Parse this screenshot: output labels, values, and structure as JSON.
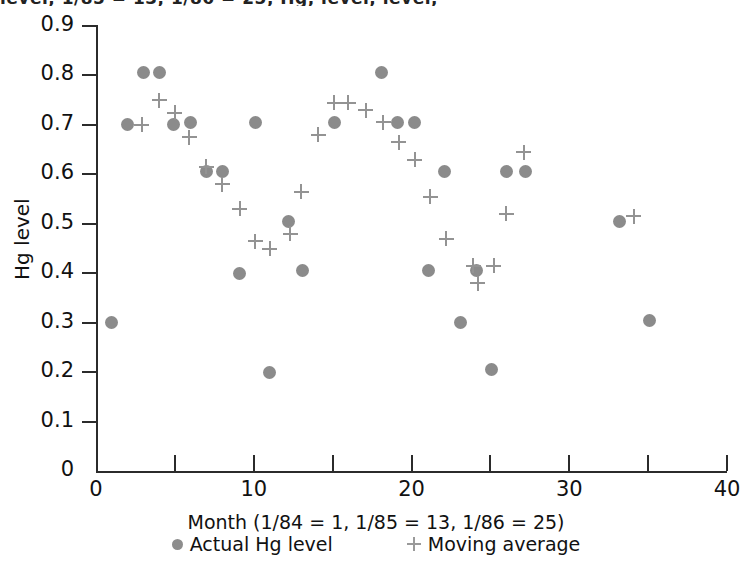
{
  "figure": {
    "cropped_header_text": "level,  1/85 = 13,  1/86 = 25,    Hg,     level,     level,"
  },
  "chart_data": {
    "type": "scatter",
    "title": "",
    "xlabel": "Month (1/84 = 1, 1/85 = 13, 1/86 = 25)",
    "ylabel": "Hg level",
    "xlim": [
      0,
      40
    ],
    "ylim": [
      0,
      0.9
    ],
    "xticks": [
      0,
      5,
      10,
      15,
      20,
      25,
      30,
      35,
      40
    ],
    "xtick_labels": [
      "0",
      "",
      "10",
      "",
      "20",
      "",
      "30",
      "",
      "40"
    ],
    "yticks": [
      0,
      0.1,
      0.2,
      0.3,
      0.4,
      0.5,
      0.6,
      0.7,
      0.8,
      0.9
    ],
    "ytick_labels": [
      "0",
      "0.1",
      "0.2",
      "0.3",
      "0.4",
      "0.5",
      "0.6",
      "0.7",
      "0.8",
      "0.9"
    ],
    "grid": false,
    "legend_position": "below-axis",
    "series": [
      {
        "name": "Actual Hg level",
        "marker": "circle",
        "color": "#8b8b8b",
        "points": [
          [
            1.0,
            0.3
          ],
          [
            2.0,
            0.7
          ],
          [
            3.0,
            0.805
          ],
          [
            4.0,
            0.805
          ],
          [
            4.9,
            0.7
          ],
          [
            6.0,
            0.705
          ],
          [
            7.0,
            0.605
          ],
          [
            8.0,
            0.605
          ],
          [
            9.1,
            0.4
          ],
          [
            10.1,
            0.705
          ],
          [
            11.0,
            0.2
          ],
          [
            12.2,
            0.505
          ],
          [
            13.1,
            0.405
          ],
          [
            15.1,
            0.705
          ],
          [
            18.1,
            0.805
          ],
          [
            19.1,
            0.705
          ],
          [
            20.2,
            0.705
          ],
          [
            21.1,
            0.405
          ],
          [
            22.1,
            0.605
          ],
          [
            23.1,
            0.3
          ],
          [
            24.1,
            0.405
          ],
          [
            25.1,
            0.205
          ],
          [
            26.0,
            0.605
          ],
          [
            27.2,
            0.605
          ],
          [
            33.2,
            0.505
          ],
          [
            35.1,
            0.305
          ]
        ]
      },
      {
        "name": "Moving average",
        "marker": "plus",
        "color": "#939393",
        "points": [
          [
            2.9,
            0.7
          ],
          [
            4.0,
            0.75
          ],
          [
            5.0,
            0.725
          ],
          [
            5.9,
            0.675
          ],
          [
            7.0,
            0.615
          ],
          [
            8.0,
            0.58
          ],
          [
            9.1,
            0.53
          ],
          [
            10.1,
            0.465
          ],
          [
            11.0,
            0.45
          ],
          [
            12.3,
            0.48
          ],
          [
            13.0,
            0.565
          ],
          [
            14.1,
            0.68
          ],
          [
            15.1,
            0.745
          ],
          [
            16.0,
            0.745
          ],
          [
            17.1,
            0.73
          ],
          [
            18.2,
            0.705
          ],
          [
            19.2,
            0.665
          ],
          [
            20.2,
            0.63
          ],
          [
            21.2,
            0.555
          ],
          [
            22.2,
            0.47
          ],
          [
            23.9,
            0.415
          ],
          [
            24.2,
            0.38
          ],
          [
            25.2,
            0.415
          ],
          [
            26.0,
            0.52
          ],
          [
            27.1,
            0.645
          ],
          [
            34.1,
            0.515
          ]
        ]
      }
    ]
  },
  "legend": {
    "items": [
      {
        "label": "Actual Hg level",
        "marker": "circle"
      },
      {
        "label": "Moving average",
        "marker": "plus"
      }
    ]
  }
}
